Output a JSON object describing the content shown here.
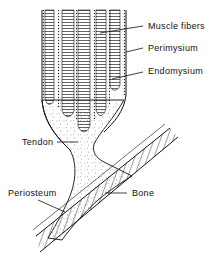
{
  "figure": {
    "type": "anatomical-diagram",
    "labels": {
      "muscle_fibers": "Muscle fibers",
      "perimysium": "Perimysium",
      "endomysium": "Endomysium",
      "tendon": "Tendon",
      "periosteum": "Periosteum",
      "bone": "Bone"
    },
    "colors": {
      "ink": "#111111",
      "background": "#ffffff"
    }
  }
}
